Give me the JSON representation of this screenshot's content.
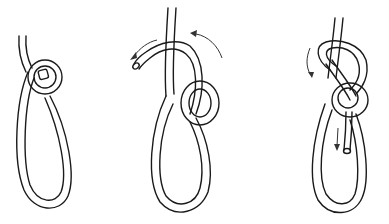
{
  "diagram": {
    "type": "knot-tying-steps",
    "background": "#ffffff",
    "line_color": "#1a1a1a",
    "steps": [
      {
        "index": 1,
        "description": "Rope end with small overhand loop formed at top of a long loop"
      },
      {
        "index": 2,
        "description": "Working end passed up through small loop and around standing part",
        "arrows": 2
      },
      {
        "index": 3,
        "description": "Working end passed back down through small loop; knot tightened",
        "arrows": 2
      }
    ]
  }
}
